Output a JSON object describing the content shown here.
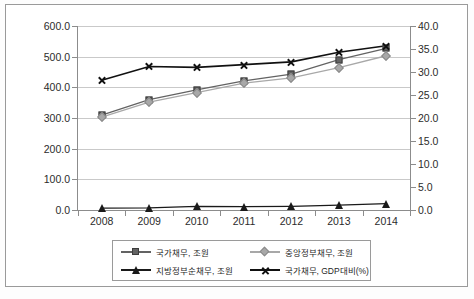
{
  "chart_data": {
    "type": "line",
    "title": "",
    "subtitle": "",
    "xlabel": "",
    "ylabel": "",
    "categories": [
      "2008",
      "2009",
      "2010",
      "2011",
      "2012",
      "2013",
      "2014"
    ],
    "x_tick_labels": [
      "2008",
      "2009",
      "2010",
      "2011",
      "2012",
      "2013",
      "2014"
    ],
    "left_axis": {
      "ylim": [
        0.0,
        600.0
      ],
      "tick_labels": [
        "0.0",
        "100.0",
        "200.0",
        "300.0",
        "400.0",
        "500.0",
        "600.0"
      ],
      "tick_values": [
        0.0,
        100.0,
        200.0,
        300.0,
        400.0,
        500.0,
        600.0
      ],
      "unit": "조원"
    },
    "right_axis": {
      "ylim": [
        0.0,
        40.0
      ],
      "tick_labels": [
        "0.0",
        "5.0",
        "10.0",
        "15.0",
        "20.0",
        "25.0",
        "30.0",
        "35.0",
        "40.0"
      ],
      "tick_values": [
        0.0,
        5.0,
        10.0,
        15.0,
        20.0,
        25.0,
        30.0,
        35.0,
        40.0
      ],
      "unit": "%"
    },
    "grid": true,
    "legend_position": "bottom",
    "series": [
      {
        "name": "국가채무, 조원",
        "axis": "left",
        "marker": "square",
        "color": "#636363",
        "values": [
          309.0,
          360.0,
          392.0,
          421.0,
          443.0,
          490.0,
          527.0
        ]
      },
      {
        "name": "중앙정부채무, 조원",
        "axis": "left",
        "marker": "diamond",
        "color": "#a8a8a8",
        "values": [
          303.0,
          352.0,
          383.0,
          414.0,
          431.0,
          464.0,
          503.0
        ]
      },
      {
        "name": "지방정부순채무, 조원",
        "axis": "left",
        "marker": "triangle",
        "color": "#1a1a1a",
        "values": [
          6.0,
          7.0,
          12.0,
          11.0,
          12.0,
          16.0,
          21.0
        ]
      },
      {
        "name": "국가채무, GDP대비(%)",
        "axis": "right",
        "marker": "x",
        "color": "#111111",
        "values": [
          28.2,
          31.2,
          31.0,
          31.6,
          32.2,
          34.3,
          35.7
        ]
      }
    ],
    "legend": [
      "국가채무, 조원",
      "중앙정부채무, 조원",
      "지방정부순채무, 조원",
      "국가채무, GDP대비(%)"
    ]
  },
  "footnote": ""
}
